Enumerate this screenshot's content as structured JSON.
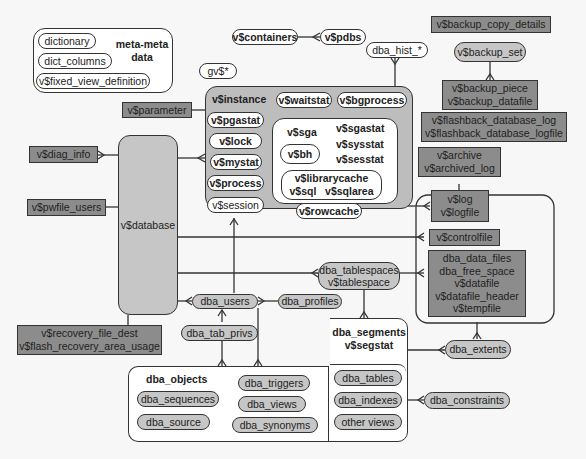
{
  "meta_box": {
    "title_line1": "meta-meta",
    "title_line2": "data",
    "items": [
      "dictionary",
      "dict_columns",
      "v$fixed_view_definition"
    ]
  },
  "top": {
    "containers": "v$containers",
    "pdbs": "v$pdbs",
    "gv": "gv$*",
    "dba_hist": "dba_hist_*"
  },
  "backup": {
    "copy_details": "v$backup_copy_details",
    "set": "v$backup_set",
    "piece_line1": "v$backup_piece",
    "piece_line2": "v$backup_datafile"
  },
  "flashback": {
    "line1": "v$flashback_database_log",
    "line2": "v$flashback_database_logfile"
  },
  "archive": {
    "line1": "v$archive",
    "line2": "v$archived_log"
  },
  "log": {
    "line1": "v$log",
    "line2": "v$logfile"
  },
  "controlfile": "v$controlfile",
  "datafiles": [
    "dba_data_files",
    "dba_free_space",
    "v$datafile",
    "v$datafile_header",
    "v$tempfile"
  ],
  "left": {
    "parameter": "v$parameter",
    "diag_info": "v$diag_info",
    "pwfile_users": "v$pwfile_users",
    "database": "v$database",
    "recovery_line1": "v$recovery_file_dest",
    "recovery_line2": "v$flash_recovery_area_usage"
  },
  "instance": {
    "title": "v$instance",
    "waitstat": "v$waitstat",
    "bgprocess": "v$bgprocess",
    "pgastat": "v$pgastat",
    "lock": "v$lock",
    "mystat": "v$mystat",
    "process": "v$process",
    "session": "v$session",
    "sga": {
      "sga": "v$sga",
      "sgastat": "v$sgastat",
      "sysstat": "v$sysstat",
      "sesstat": "v$sesstat",
      "bh": "v$bh",
      "librarycache": "v$librarycache",
      "sql": "v$sql",
      "sqlarea": "v$sqlarea",
      "rowcache": "v$rowcache"
    }
  },
  "users": {
    "tablespaces_line1": "dba_tablespaces",
    "tablespaces_line2": "v$tablespace",
    "users": "dba_users",
    "profiles": "dba_profiles",
    "tab_privs": "dba_tab_privs"
  },
  "objects": {
    "title": "dba_objects",
    "sequences": "dba_sequences",
    "source": "dba_source",
    "triggers": "dba_triggers",
    "views": "dba_views",
    "synonyms": "dba_synonyms"
  },
  "segments": {
    "title_line1": "dba_segments",
    "title_line2": "v$segstat",
    "tables": "dba_tables",
    "indexes": "dba_indexes",
    "other": "other views",
    "extents": "dba_extents",
    "constraints": "dba_constraints"
  },
  "colors": {
    "background": "#f7f7f7",
    "dark_box": "#8c8c8c",
    "gray_pill": "#c6c6c6",
    "gray_frame": "#bdbdbd",
    "line": "#333333"
  }
}
